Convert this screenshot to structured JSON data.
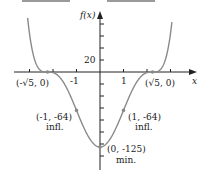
{
  "chart_data": {
    "type": "line",
    "title": "",
    "function": "f(x) = (x^2 - 5)^3",
    "xlabel": "x",
    "ylabel": "f(x)",
    "x_ticks": [
      -4,
      -3,
      -2,
      -1,
      0,
      1,
      2,
      3
    ],
    "x_tick_labels": [
      {
        "x": -1,
        "label": "-1"
      },
      {
        "x": 1,
        "label": "1"
      }
    ],
    "y_tick_labels": [
      {
        "y": 20,
        "label": "20"
      }
    ],
    "y_tick_step": 20,
    "xlim": [
      -3.6,
      4.0
    ],
    "ylim": [
      -160,
      100
    ],
    "grid": false,
    "points": [
      {
        "x": -2.236,
        "y": 0,
        "label": "(-√5, 0)",
        "note": ""
      },
      {
        "x": 2.236,
        "y": 0,
        "label": "(√5, 0)",
        "note": ""
      },
      {
        "x": -1,
        "y": -64,
        "label": "(-1, -64)",
        "note": "infl."
      },
      {
        "x": 1,
        "y": -64,
        "label": "(1, -64)",
        "note": "infl."
      },
      {
        "x": 0,
        "y": -125,
        "label": "(0, -125)",
        "note": "min."
      }
    ]
  },
  "labels": {
    "y_axis": "f(x)",
    "x_axis": "x",
    "tick_20": "20",
    "tick_neg1": "-1",
    "tick_1": "1",
    "root_left": "(-√5, 0)",
    "root_right": "(√5, 0)",
    "infl_left": "(-1, -64)",
    "infl_left_note": "infl.",
    "infl_right": "(1, -64)",
    "infl_right_note": "infl.",
    "min_point": "(0, -125)",
    "min_note": "min."
  }
}
